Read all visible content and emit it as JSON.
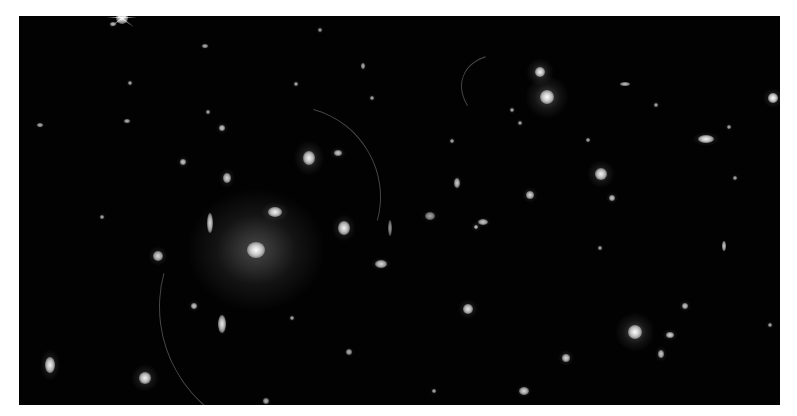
{
  "image": {
    "description": "Deep-field astronomical image of a galaxy cluster with elliptical galaxies, gravitational lensing arcs and background galaxies on a black background",
    "frame": {
      "x": 19,
      "y": 16,
      "width": 761,
      "height": 389
    },
    "background_color": "#020202",
    "border_color": "#ffffff"
  },
  "objects": [
    {
      "type": "bcg",
      "x": 256,
      "y": 250,
      "rx": 9,
      "ry": 8,
      "halo": 70,
      "brightness": 1.0
    },
    {
      "type": "galaxy",
      "x": 275,
      "y": 212,
      "rx": 7,
      "ry": 5,
      "halo": 14,
      "brightness": 0.95
    },
    {
      "type": "galaxy",
      "x": 210,
      "y": 223,
      "rx": 3,
      "ry": 10,
      "halo": 12,
      "brightness": 0.85
    },
    {
      "type": "galaxy",
      "x": 344,
      "y": 228,
      "rx": 6,
      "ry": 7,
      "halo": 14,
      "brightness": 0.95
    },
    {
      "type": "galaxy",
      "x": 309,
      "y": 158,
      "rx": 6,
      "ry": 7,
      "halo": 18,
      "brightness": 0.95
    },
    {
      "type": "galaxy",
      "x": 338,
      "y": 153,
      "rx": 4,
      "ry": 3,
      "halo": 8,
      "brightness": 0.8
    },
    {
      "type": "galaxy",
      "x": 547,
      "y": 97,
      "rx": 7,
      "ry": 7,
      "halo": 22,
      "brightness": 1.0
    },
    {
      "type": "galaxy",
      "x": 540,
      "y": 72,
      "rx": 5,
      "ry": 5,
      "halo": 14,
      "brightness": 0.95
    },
    {
      "type": "galaxy",
      "x": 706,
      "y": 139,
      "rx": 8,
      "ry": 4,
      "halo": 14,
      "brightness": 0.95
    },
    {
      "type": "star",
      "x": 773,
      "y": 98,
      "rx": 5,
      "ry": 5,
      "halo": 10,
      "brightness": 1.0
    },
    {
      "type": "galaxy",
      "x": 601,
      "y": 174,
      "rx": 6,
      "ry": 6,
      "halo": 14,
      "brightness": 0.95
    },
    {
      "type": "galaxy",
      "x": 635,
      "y": 332,
      "rx": 7,
      "ry": 7,
      "halo": 20,
      "brightness": 1.0
    },
    {
      "type": "galaxy",
      "x": 670,
      "y": 335,
      "rx": 4,
      "ry": 3,
      "halo": 8,
      "brightness": 0.85
    },
    {
      "type": "galaxy",
      "x": 661,
      "y": 354,
      "rx": 3,
      "ry": 4,
      "halo": 8,
      "brightness": 0.8
    },
    {
      "type": "galaxy",
      "x": 685,
      "y": 306,
      "rx": 3,
      "ry": 3,
      "halo": 6,
      "brightness": 0.8
    },
    {
      "type": "galaxy",
      "x": 50,
      "y": 365,
      "rx": 5,
      "ry": 8,
      "halo": 16,
      "brightness": 0.95
    },
    {
      "type": "galaxy",
      "x": 145,
      "y": 378,
      "rx": 6,
      "ry": 6,
      "halo": 14,
      "brightness": 0.95
    },
    {
      "type": "galaxy",
      "x": 222,
      "y": 324,
      "rx": 4,
      "ry": 9,
      "halo": 12,
      "brightness": 0.9
    },
    {
      "type": "galaxy",
      "x": 158,
      "y": 256,
      "rx": 5,
      "ry": 5,
      "halo": 10,
      "brightness": 0.85
    },
    {
      "type": "galaxy",
      "x": 194,
      "y": 306,
      "rx": 3,
      "ry": 3,
      "halo": 6,
      "brightness": 0.8
    },
    {
      "type": "galaxy",
      "x": 227,
      "y": 178,
      "rx": 4,
      "ry": 5,
      "halo": 10,
      "brightness": 0.85
    },
    {
      "type": "galaxy",
      "x": 222,
      "y": 128,
      "rx": 3,
      "ry": 3,
      "halo": 6,
      "brightness": 0.8
    },
    {
      "type": "galaxy",
      "x": 183,
      "y": 162,
      "rx": 3,
      "ry": 3,
      "halo": 6,
      "brightness": 0.8
    },
    {
      "type": "galaxy",
      "x": 208,
      "y": 112,
      "rx": 2,
      "ry": 2,
      "halo": 4,
      "brightness": 0.7
    },
    {
      "type": "galaxy",
      "x": 381,
      "y": 264,
      "rx": 6,
      "ry": 4,
      "halo": 10,
      "brightness": 0.85
    },
    {
      "type": "galaxy",
      "x": 468,
      "y": 309,
      "rx": 5,
      "ry": 5,
      "halo": 10,
      "brightness": 0.9
    },
    {
      "type": "galaxy",
      "x": 476,
      "y": 227,
      "rx": 2,
      "ry": 2,
      "halo": 5,
      "brightness": 0.8
    },
    {
      "type": "galaxy",
      "x": 483,
      "y": 222,
      "rx": 5,
      "ry": 3,
      "halo": 8,
      "brightness": 0.8
    },
    {
      "type": "galaxy",
      "x": 530,
      "y": 195,
      "rx": 4,
      "ry": 4,
      "halo": 8,
      "brightness": 0.85
    },
    {
      "type": "galaxy",
      "x": 457,
      "y": 183,
      "rx": 3,
      "ry": 5,
      "halo": 8,
      "brightness": 0.8
    },
    {
      "type": "galaxy",
      "x": 452,
      "y": 141,
      "rx": 2,
      "ry": 2,
      "halo": 4,
      "brightness": 0.7
    },
    {
      "type": "galaxy",
      "x": 566,
      "y": 358,
      "rx": 4,
      "ry": 4,
      "halo": 8,
      "brightness": 0.85
    },
    {
      "type": "galaxy",
      "x": 524,
      "y": 391,
      "rx": 5,
      "ry": 4,
      "halo": 8,
      "brightness": 0.85
    },
    {
      "type": "galaxy",
      "x": 600,
      "y": 248,
      "rx": 2,
      "ry": 2,
      "halo": 4,
      "brightness": 0.7
    },
    {
      "type": "galaxy",
      "x": 612,
      "y": 198,
      "rx": 3,
      "ry": 3,
      "halo": 6,
      "brightness": 0.8
    },
    {
      "type": "galaxy",
      "x": 724,
      "y": 246,
      "rx": 2,
      "ry": 5,
      "halo": 6,
      "brightness": 0.8
    },
    {
      "type": "galaxy",
      "x": 735,
      "y": 178,
      "rx": 2,
      "ry": 2,
      "halo": 4,
      "brightness": 0.7
    },
    {
      "type": "galaxy",
      "x": 729,
      "y": 127,
      "rx": 2,
      "ry": 2,
      "halo": 4,
      "brightness": 0.7
    },
    {
      "type": "galaxy",
      "x": 625,
      "y": 84,
      "rx": 5,
      "ry": 2,
      "halo": 6,
      "brightness": 0.75
    },
    {
      "type": "galaxy",
      "x": 520,
      "y": 123,
      "rx": 2,
      "ry": 2,
      "halo": 4,
      "brightness": 0.7
    },
    {
      "type": "galaxy",
      "x": 512,
      "y": 110,
      "rx": 2,
      "ry": 2,
      "halo": 4,
      "brightness": 0.7
    },
    {
      "type": "galaxy",
      "x": 363,
      "y": 66,
      "rx": 2,
      "ry": 3,
      "halo": 5,
      "brightness": 0.7
    },
    {
      "type": "galaxy",
      "x": 372,
      "y": 98,
      "rx": 2,
      "ry": 2,
      "halo": 4,
      "brightness": 0.7
    },
    {
      "type": "galaxy",
      "x": 296,
      "y": 84,
      "rx": 2,
      "ry": 2,
      "halo": 4,
      "brightness": 0.7
    },
    {
      "type": "galaxy",
      "x": 205,
      "y": 46,
      "rx": 3,
      "ry": 2,
      "halo": 5,
      "brightness": 0.7
    },
    {
      "type": "galaxy",
      "x": 40,
      "y": 125,
      "rx": 3,
      "ry": 2,
      "halo": 5,
      "brightness": 0.7
    },
    {
      "type": "galaxy",
      "x": 127,
      "y": 121,
      "rx": 3,
      "ry": 2,
      "halo": 5,
      "brightness": 0.7
    },
    {
      "type": "galaxy",
      "x": 130,
      "y": 83,
      "rx": 2,
      "ry": 2,
      "halo": 4,
      "brightness": 0.7
    },
    {
      "type": "galaxy",
      "x": 113,
      "y": 24,
      "rx": 3,
      "ry": 2,
      "halo": 5,
      "brightness": 0.75
    },
    {
      "type": "galaxy",
      "x": 292,
      "y": 318,
      "rx": 2,
      "ry": 2,
      "halo": 4,
      "brightness": 0.7
    },
    {
      "type": "galaxy",
      "x": 349,
      "y": 352,
      "rx": 3,
      "ry": 3,
      "halo": 5,
      "brightness": 0.7
    },
    {
      "type": "galaxy",
      "x": 266,
      "y": 401,
      "rx": 3,
      "ry": 3,
      "halo": 5,
      "brightness": 0.7
    },
    {
      "type": "galaxy",
      "x": 434,
      "y": 391,
      "rx": 2,
      "ry": 2,
      "halo": 4,
      "brightness": 0.7
    },
    {
      "type": "galaxy",
      "x": 588,
      "y": 140,
      "rx": 2,
      "ry": 2,
      "halo": 4,
      "brightness": 0.7
    },
    {
      "type": "galaxy",
      "x": 656,
      "y": 105,
      "rx": 2,
      "ry": 2,
      "halo": 4,
      "brightness": 0.7
    },
    {
      "type": "galaxy",
      "x": 770,
      "y": 325,
      "rx": 2,
      "ry": 2,
      "halo": 4,
      "brightness": 0.7
    },
    {
      "type": "galaxy",
      "x": 102,
      "y": 217,
      "rx": 2,
      "ry": 2,
      "halo": 4,
      "brightness": 0.7
    },
    {
      "type": "galaxy",
      "x": 320,
      "y": 30,
      "rx": 2,
      "ry": 2,
      "halo": 4,
      "brightness": 0.65
    },
    {
      "type": "galaxy",
      "x": 430,
      "y": 216,
      "rx": 5,
      "ry": 4,
      "halo": 8,
      "brightness": 0.65
    },
    {
      "type": "galaxy",
      "x": 390,
      "y": 228,
      "rx": 2,
      "ry": 8,
      "halo": 6,
      "brightness": 0.6
    }
  ],
  "bright_star": {
    "x": 122,
    "y": 18
  }
}
